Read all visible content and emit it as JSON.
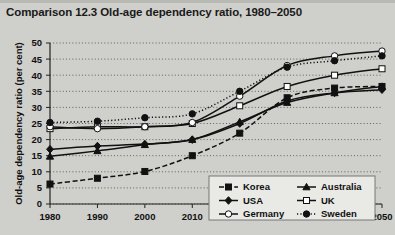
{
  "chart_title": "Comparison 12.3  Old-age dependency ratio, 1980–2050",
  "axes": {
    "ylabel": "Old-age dependency ratio (per cent)",
    "xlabel": "",
    "yticks": [
      "0",
      "5",
      "10",
      "15",
      "20",
      "25",
      "30",
      "35",
      "40",
      "45",
      "50"
    ],
    "xticks": [
      "1980",
      "1990",
      "2000",
      "2010",
      "2020",
      "2030",
      "2040",
      "2050"
    ]
  },
  "legend": {
    "entries": [
      {
        "label": "Korea",
        "marker": "filled-square",
        "dash": "dashed"
      },
      {
        "label": "Australia",
        "marker": "filled-triangle",
        "dash": "solid"
      },
      {
        "label": "USA",
        "marker": "filled-diamond",
        "dash": "solid"
      },
      {
        "label": "UK",
        "marker": "open-square",
        "dash": "solid"
      },
      {
        "label": "Germany",
        "marker": "open-circle",
        "dash": "solid"
      },
      {
        "label": "Sweden",
        "marker": "filled-circle",
        "dash": "dotted"
      }
    ]
  },
  "chart_data": {
    "type": "line",
    "title": "Comparison 12.3  Old-age dependency ratio, 1980–2050",
    "xlabel": "",
    "ylabel": "Old-age dependency ratio (per cent)",
    "x": [
      1980,
      1990,
      2000,
      2010,
      2020,
      2030,
      2040,
      2050
    ],
    "xlim": [
      1980,
      2050
    ],
    "ylim": [
      0,
      50
    ],
    "grid": true,
    "legend_position": "inside-lower-right",
    "series": [
      {
        "name": "Korea",
        "values": [
          6.2,
          8.0,
          10.1,
          15.0,
          22.0,
          33.0,
          36.0,
          36.5
        ]
      },
      {
        "name": "Australia",
        "values": [
          14.8,
          16.5,
          18.4,
          20.0,
          25.5,
          31.5,
          34.5,
          36.5
        ]
      },
      {
        "name": "USA",
        "values": [
          17.0,
          18.0,
          18.6,
          20.0,
          25.0,
          32.0,
          34.5,
          35.5
        ]
      },
      {
        "name": "UK",
        "values": [
          23.4,
          24.0,
          24.0,
          25.0,
          30.5,
          36.5,
          40.0,
          42.0
        ]
      },
      {
        "name": "Germany",
        "values": [
          24.0,
          23.4,
          24.0,
          25.3,
          33.5,
          43.0,
          46.0,
          47.5
        ]
      },
      {
        "name": "Sweden",
        "values": [
          25.3,
          25.7,
          26.8,
          28.0,
          35.0,
          42.5,
          44.5,
          46.0
        ]
      }
    ]
  }
}
